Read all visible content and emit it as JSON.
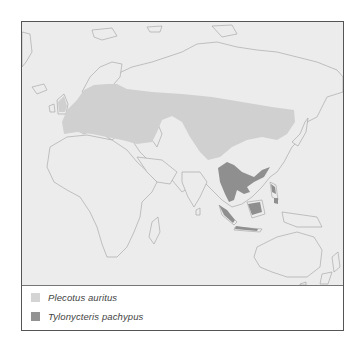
{
  "map": {
    "title": "",
    "region": "Old World (Europe, Asia, Africa, Australia)",
    "colors": {
      "ocean": "#ececec",
      "land": "#ececec",
      "coastline": "#9a9a9a",
      "plecotus_auritus": "#cfcfcf",
      "tylonycteris_pachypus": "#8f8f8f",
      "frame": "#555555"
    }
  },
  "legend": {
    "items": [
      {
        "label": "Plecotus auritus",
        "color": "#d4d4d4"
      },
      {
        "label": "Tylonycteris pachypus",
        "color": "#939393"
      }
    ]
  }
}
